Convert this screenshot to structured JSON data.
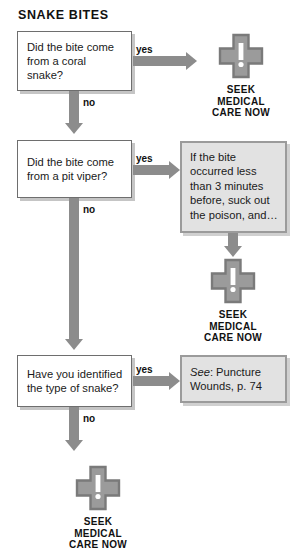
{
  "title": "SNAKE BITES",
  "colors": {
    "arrow_gray": "#8c8c8c",
    "cross_fill": "#9b9b9b",
    "cross_border": "#7a7a7a",
    "gray_box_fill": "#e2e2e2",
    "gray_box_border": "#9b9b9b",
    "text": "#1a1a1a"
  },
  "labels": {
    "yes": "yes",
    "no": "no"
  },
  "questions": [
    {
      "id": "coral-snake",
      "text": "Did the bite come from a coral snake?"
    },
    {
      "id": "pit-viper",
      "text": "Did the bite come from a pit viper?"
    },
    {
      "id": "identified-snake",
      "text": "Have you identified the type of snake?"
    }
  ],
  "action_boxes": [
    {
      "id": "suck-poison",
      "text": "If the bite occurred less than 3 minutes before, suck out the poison, and…"
    },
    {
      "id": "see-reference",
      "text_italic": "See",
      "text_rest": ": Puncture Wounds, p. 74"
    }
  ],
  "seek_blocks": [
    {
      "id": "seek-1",
      "line1": "SEEK",
      "line2": "MEDICAL",
      "line3": "CARE NOW",
      "icon": "medical-cross-alert-icon"
    },
    {
      "id": "seek-2",
      "line1": "SEEK",
      "line2": "MEDICAL",
      "line3": "CARE NOW",
      "icon": "medical-cross-alert-icon"
    },
    {
      "id": "seek-3",
      "line1": "SEEK",
      "line2": "MEDICAL",
      "line3": "CARE NOW",
      "icon": "medical-cross-alert-icon"
    }
  ]
}
